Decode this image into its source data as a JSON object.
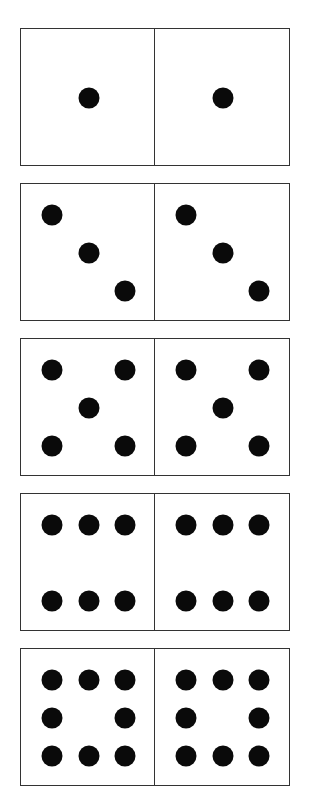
{
  "pip_color": "#0a0a0a",
  "border_color": "#333333",
  "dominoes": [
    {
      "top": 28,
      "left_value": 1,
      "right_value": 1,
      "pips": [
        [
          2,
          2
        ]
      ]
    },
    {
      "top": 183,
      "left_value": 3,
      "right_value": 3,
      "pips": [
        [
          1,
          1
        ],
        [
          2,
          2
        ],
        [
          3,
          3
        ]
      ]
    },
    {
      "top": 338,
      "left_value": 5,
      "right_value": 5,
      "pips": [
        [
          1,
          1
        ],
        [
          3,
          1
        ],
        [
          2,
          2
        ],
        [
          1,
          3
        ],
        [
          3,
          3
        ]
      ]
    },
    {
      "top": 493,
      "left_value": 6,
      "right_value": 6,
      "pips": [
        [
          1,
          1
        ],
        [
          2,
          1
        ],
        [
          3,
          1
        ],
        [
          1,
          3
        ],
        [
          2,
          3
        ],
        [
          3,
          3
        ]
      ]
    },
    {
      "top": 648,
      "left_value": 8,
      "right_value": 8,
      "pips": [
        [
          1,
          1
        ],
        [
          2,
          1
        ],
        [
          3,
          1
        ],
        [
          1,
          2
        ],
        [
          3,
          2
        ],
        [
          1,
          3
        ],
        [
          2,
          3
        ],
        [
          3,
          3
        ]
      ]
    }
  ]
}
